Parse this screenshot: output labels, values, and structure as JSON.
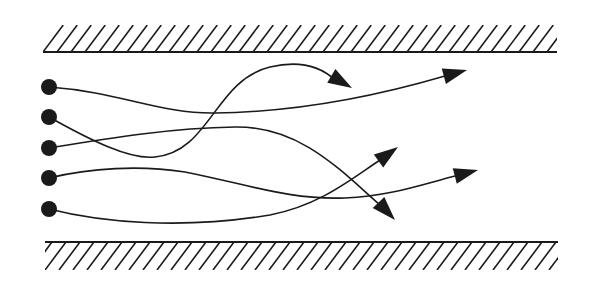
{
  "diagram": {
    "colors": {
      "background": "#ffffff",
      "ink": "#1a1a1a"
    },
    "walls": {
      "top": {
        "x1": 43,
        "x2": 557,
        "line_y": 52,
        "hatch_top": 25
      },
      "bottom": {
        "x1": 45,
        "x2": 558,
        "line_y": 242,
        "hatch_bottom": 270
      },
      "hatch_spacing": 14
    },
    "particles": [
      {
        "id": 1,
        "x": 49,
        "y": 87
      },
      {
        "id": 2,
        "x": 49,
        "y": 117
      },
      {
        "id": 3,
        "x": 49,
        "y": 148
      },
      {
        "id": 4,
        "x": 49,
        "y": 178
      },
      {
        "id": 5,
        "x": 49,
        "y": 209
      }
    ],
    "trajectories": [
      {
        "from": 1,
        "path": "M49,87 C120,92 160,114 215,113 C300,112 380,95 445,76",
        "arrow_tip": [
          467,
          70
        ],
        "arrow_base": [
          445,
          76
        ]
      },
      {
        "from": 2,
        "path": "M49,117 C90,140 130,160 155,157 C210,152 215,80 270,67 C300,60 320,66 335,80",
        "arrow_tip": [
          352,
          88
        ],
        "arrow_base": [
          335,
          78
        ]
      },
      {
        "from": 3,
        "path": "M49,148 C110,138 170,128 235,127 C300,126 340,170 380,205",
        "arrow_tip": [
          395,
          220
        ],
        "arrow_base": [
          378,
          202
        ]
      },
      {
        "from": 4,
        "path": "M49,178 C90,168 140,165 185,172 C250,185 290,200 345,198 C390,196 420,185 455,176",
        "arrow_tip": [
          478,
          170
        ],
        "arrow_base": [
          455,
          176
        ]
      },
      {
        "from": 5,
        "path": "M49,209 C100,222 180,230 270,215 C320,205 350,180 380,160",
        "arrow_tip": [
          398,
          147
        ],
        "arrow_base": [
          380,
          160
        ]
      }
    ]
  }
}
